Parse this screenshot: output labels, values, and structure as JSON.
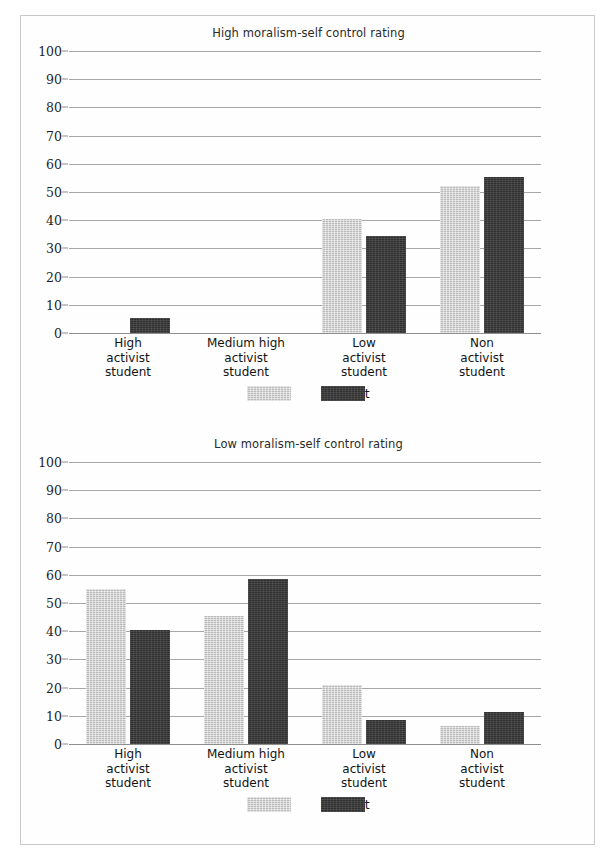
{
  "figure": {
    "legend": {
      "father_label": "Father",
      "student_label": "Student",
      "father_color": "#b9b9b9",
      "student_color": "#303030"
    },
    "yaxis_ticks": [
      "100",
      "90",
      "80",
      "70",
      "60",
      "50",
      "40",
      "30",
      "20",
      "10",
      "0"
    ],
    "categories_lines": [
      [
        "High",
        "activist",
        "student"
      ],
      [
        "Medium high",
        "activist",
        "student"
      ],
      [
        "Low",
        "activist",
        "student"
      ],
      [
        "Non",
        "activist",
        "student"
      ]
    ]
  },
  "chart_data": [
    {
      "type": "bar",
      "title": "High moralism-self control rating",
      "xlabel": "",
      "ylabel": "",
      "ylim": [
        0,
        100
      ],
      "yticks": [
        0,
        10,
        20,
        30,
        40,
        50,
        60,
        70,
        80,
        90,
        100
      ],
      "grid": true,
      "legend_position": "bottom-center",
      "categories": [
        "High activist student",
        "Medium high activist student",
        "Low activist student",
        "Non activist student"
      ],
      "series": [
        {
          "name": "Father",
          "color": "#b9b9b9",
          "values": [
            0,
            0,
            40.5,
            52
          ]
        },
        {
          "name": "Student",
          "color": "#303030",
          "values": [
            5.5,
            0,
            34.5,
            55.5
          ]
        }
      ]
    },
    {
      "type": "bar",
      "title": "Low moralism-self control rating",
      "xlabel": "",
      "ylabel": "",
      "ylim": [
        0,
        100
      ],
      "yticks": [
        0,
        10,
        20,
        30,
        40,
        50,
        60,
        70,
        80,
        90,
        100
      ],
      "grid": true,
      "legend_position": "bottom-center",
      "categories": [
        "High activist student",
        "Medium high activist student",
        "Low activist student",
        "Non activist student"
      ],
      "series": [
        {
          "name": "Father",
          "color": "#b9b9b9",
          "values": [
            55,
            45.5,
            20.8,
            6.5
          ]
        },
        {
          "name": "Student",
          "color": "#303030",
          "values": [
            40.5,
            58.5,
            8.5,
            11.5
          ]
        }
      ]
    }
  ]
}
